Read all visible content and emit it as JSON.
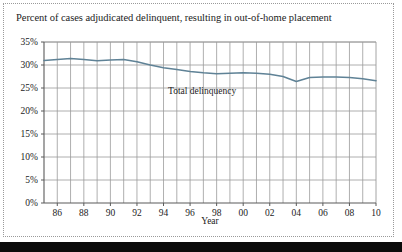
{
  "figure": {
    "title": "Percent of cases adjudicated delinquent, resulting in out-of-home placement",
    "series_label": "Total delinquency",
    "xaxis_title": "Year",
    "line_color": "#5f8296",
    "grid_color": "#9a9a9a",
    "axis_color": "#5a5a5a",
    "text_color": "#1b1b1b"
  },
  "chart_data": {
    "type": "line",
    "title": "Percent of cases adjudicated delinquent, resulting in out-of-home placement",
    "xlabel": "Year",
    "ylabel": "",
    "ylim": [
      0,
      35
    ],
    "ytick_labels": [
      "0%",
      "5%",
      "10%",
      "15%",
      "20%",
      "25%",
      "30%",
      "35%"
    ],
    "ytick_values": [
      0,
      5,
      10,
      15,
      20,
      25,
      30,
      35
    ],
    "xtick_labels": [
      "86",
      "88",
      "90",
      "92",
      "94",
      "96",
      "98",
      "00",
      "02",
      "04",
      "06",
      "08",
      "10"
    ],
    "xtick_values": [
      1986,
      1988,
      1990,
      1992,
      1994,
      1996,
      1998,
      2000,
      2002,
      2004,
      2006,
      2008,
      2010
    ],
    "xlim": [
      1985,
      2010
    ],
    "grid": true,
    "legend_position": "inline-annotation",
    "annotations": [
      {
        "text": "Total delinquency",
        "x": 1995.5,
        "y": 23.0
      }
    ],
    "series": [
      {
        "name": "Total delinquency",
        "x": [
          1985,
          1986,
          1987,
          1988,
          1989,
          1990,
          1991,
          1992,
          1993,
          1994,
          1995,
          1996,
          1997,
          1998,
          1999,
          2000,
          2001,
          2002,
          2003,
          2004,
          2005,
          2006,
          2007,
          2008,
          2009,
          2010
        ],
        "values": [
          31.0,
          31.2,
          31.4,
          31.2,
          30.9,
          31.1,
          31.2,
          30.7,
          30.0,
          29.4,
          29.0,
          28.6,
          28.3,
          28.1,
          28.2,
          28.3,
          28.2,
          28.0,
          27.5,
          26.4,
          27.3,
          27.4,
          27.4,
          27.3,
          27.0,
          26.6
        ]
      }
    ]
  }
}
